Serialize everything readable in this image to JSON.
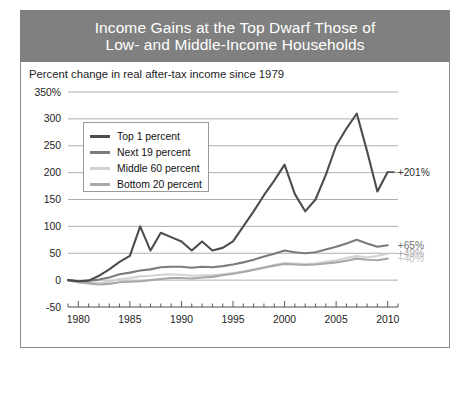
{
  "header": {
    "line1": "Income Gains at the Top Dwarf Those of",
    "line2": "Low- and Middle-Income Households",
    "background": "#808080",
    "text_color": "#ffffff"
  },
  "panel": {
    "subtitle": "Percent change in real after-tax income since 1979"
  },
  "legend": {
    "position": "inside-top-left",
    "items": [
      {
        "label": "Top 1 percent",
        "color": "#4d4d4d"
      },
      {
        "label": "Next 19 percent",
        "color": "#7b7b7b"
      },
      {
        "label": "Middle 60 percent",
        "color": "#d2d2d2"
      },
      {
        "label": "Bottom 20 percent",
        "color": "#a8a8a8"
      }
    ]
  },
  "annotations": [
    {
      "text": "+201%",
      "series": "Top 1 percent",
      "value": 201,
      "color": "#303030"
    },
    {
      "text": "+65%",
      "series": "Next 19 percent",
      "value": 65,
      "color": "#6f6f6f"
    },
    {
      "text": "+49%",
      "series": "Middle 60 percent",
      "value": 49,
      "color": "#a0a0a0"
    },
    {
      "text": "+40%",
      "series": "Bottom 20 percent",
      "value": 40,
      "color": "#c4c4c4"
    }
  ],
  "chart_data": {
    "type": "line",
    "title": "Income Gains at the Top Dwarf Those of Low- and Middle-Income Households",
    "subtitle": "Percent change in real after-tax income since 1979",
    "xlabel": "",
    "ylabel": "",
    "grid": true,
    "xlim": [
      1979,
      2011
    ],
    "ylim": [
      -50,
      350
    ],
    "ytick_step": 50,
    "yticks": [
      -50,
      0,
      50,
      100,
      150,
      200,
      250,
      300,
      350
    ],
    "ytick_labels": [
      "-50",
      "0",
      "50",
      "100",
      "150",
      "200",
      "250",
      "300",
      "350%"
    ],
    "xticks": [
      1980,
      1985,
      1990,
      1995,
      2000,
      2005,
      2010
    ],
    "xtick_labels": [
      "1980",
      "1985",
      "1990",
      "1995",
      "2000",
      "2005",
      "2010"
    ],
    "x": [
      1979,
      1980,
      1981,
      1982,
      1983,
      1984,
      1985,
      1986,
      1987,
      1988,
      1989,
      1990,
      1991,
      1992,
      1993,
      1994,
      1995,
      1996,
      1997,
      1998,
      1999,
      2000,
      2001,
      2002,
      2003,
      2004,
      2005,
      2006,
      2007,
      2008,
      2009,
      2010
    ],
    "series": [
      {
        "name": "Top 1 percent",
        "color": "#4d4d4d",
        "values": [
          0,
          -2,
          -1,
          8,
          20,
          34,
          45,
          100,
          55,
          88,
          80,
          72,
          55,
          72,
          55,
          60,
          72,
          100,
          128,
          158,
          185,
          215,
          160,
          128,
          150,
          196,
          250,
          282,
          310,
          240,
          165,
          201
        ]
      },
      {
        "name": "Next 19 percent",
        "color": "#7b7b7b",
        "values": [
          0,
          -2,
          -1,
          1,
          5,
          11,
          14,
          18,
          20,
          24,
          25,
          25,
          23,
          25,
          24,
          26,
          29,
          33,
          38,
          44,
          49,
          55,
          52,
          50,
          52,
          57,
          62,
          68,
          75,
          68,
          62,
          65
        ]
      },
      {
        "name": "Middle 60 percent",
        "color": "#d2d2d2",
        "values": [
          0,
          -3,
          -4,
          -5,
          -3,
          2,
          4,
          7,
          8,
          10,
          11,
          10,
          8,
          9,
          9,
          11,
          13,
          16,
          20,
          24,
          28,
          32,
          31,
          30,
          31,
          34,
          37,
          41,
          45,
          42,
          45,
          49
        ]
      },
      {
        "name": "Bottom 20 percent",
        "color": "#a8a8a8",
        "values": [
          0,
          -4,
          -6,
          -8,
          -7,
          -4,
          -3,
          -2,
          0,
          2,
          4,
          4,
          3,
          5,
          6,
          9,
          12,
          15,
          19,
          23,
          27,
          30,
          29,
          28,
          29,
          31,
          33,
          36,
          40,
          38,
          37,
          40
        ]
      }
    ]
  }
}
